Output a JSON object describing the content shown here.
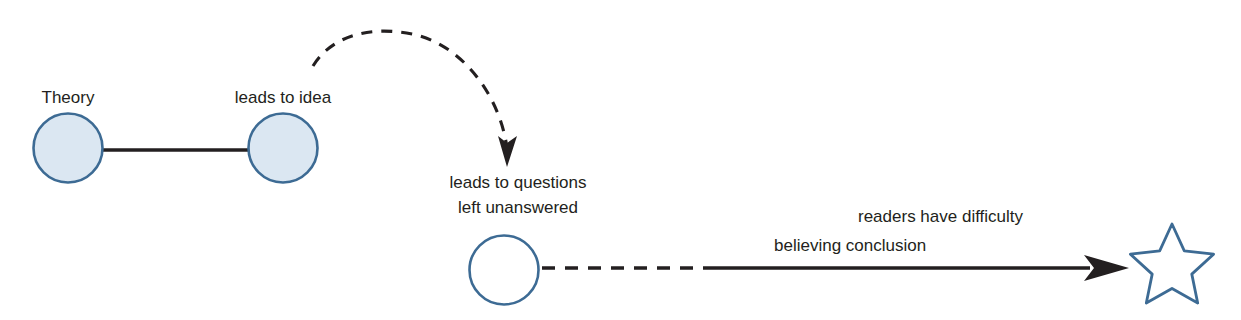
{
  "diagram": {
    "background_color": "#ffffff",
    "palette": {
      "node_fill_filled": "#dbe7f2",
      "node_fill_empty": "#ffffff",
      "node_stroke": "#3d6b94",
      "star_stroke": "#3d6b94",
      "connector": "#231f20",
      "text": "#231f20"
    },
    "labels": {
      "theory": "Theory",
      "leads_to_idea": "leads to idea",
      "leads_to_questions_line1": "leads to questions",
      "leads_to_questions_line2": "left unanswered",
      "readers_have_difficulty": "readers have difficulty",
      "believing_conclusion": "believing conclusion"
    },
    "nodes": [
      {
        "id": "theory-node",
        "shape": "circle",
        "cx": 68,
        "cy": 148,
        "r": 35,
        "fill": "filled"
      },
      {
        "id": "idea-node",
        "shape": "circle",
        "cx": 283,
        "cy": 148,
        "r": 35,
        "fill": "filled"
      },
      {
        "id": "questions-node",
        "shape": "circle",
        "cx": 504,
        "cy": 270,
        "r": 35,
        "fill": "empty"
      },
      {
        "id": "conclusion-star",
        "shape": "star",
        "cx": 1172,
        "cy": 262,
        "points": 5,
        "radius": 40
      }
    ],
    "connectors": [
      {
        "id": "theory-to-idea",
        "style": "solid",
        "arrow": false,
        "from": "theory-node",
        "to": "idea-node"
      },
      {
        "id": "idea-to-questions",
        "style": "dashed-curved",
        "arrow": true,
        "from": "idea-node",
        "to": "questions-node"
      },
      {
        "id": "questions-to-star",
        "style": "dashed-then-solid",
        "arrow": true,
        "from": "questions-node",
        "to": "conclusion-star"
      }
    ]
  }
}
